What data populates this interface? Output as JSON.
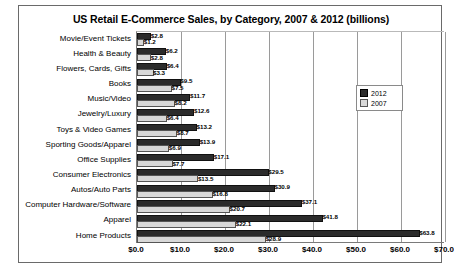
{
  "chart_data": {
    "type": "bar",
    "orientation": "horizontal",
    "title": "US Retail E-Commerce Sales, by Category, 2007 & 2012 (billions)",
    "xlabel": "",
    "ylabel": "",
    "xlim": [
      0,
      70
    ],
    "xtick_step": 10,
    "grid": true,
    "legend_position": "upper right",
    "categories": [
      "Movie/Event Tickets",
      "Health & Beauty",
      "Flowers, Cards, Gifts",
      "Books",
      "Music/Video",
      "Jewelry/Luxury",
      "Toys & Video Games",
      "Sporting Goods/Apparel",
      "Office Supplies",
      "Consumer Electronics",
      "Autos/Auto Parts",
      "Computer Hardware/Software",
      "Apparel",
      "Home Products"
    ],
    "series": [
      {
        "name": "2012",
        "color": "#2b2b2b",
        "values": [
          2.8,
          6.2,
          6.4,
          9.5,
          11.7,
          12.6,
          13.2,
          13.9,
          17.1,
          29.5,
          30.9,
          37.1,
          41.8,
          63.8
        ],
        "labels": [
          "$2.8",
          "$6.2",
          "$6.4",
          "$9.5",
          "$11.7",
          "$12.6",
          "$13.2",
          "$13.9",
          "$17.1",
          "$29.5",
          "$30.9",
          "$37.1",
          "$41.8",
          "$63.8"
        ]
      },
      {
        "name": "2007",
        "color": "#d8d8d8",
        "values": [
          1.2,
          2.8,
          3.3,
          7.5,
          8.2,
          6.4,
          8.7,
          6.9,
          7.7,
          13.5,
          16.8,
          20.7,
          22.1,
          28.9
        ],
        "labels": [
          "$1.2",
          "$2.8",
          "$3.3",
          "$7.5",
          "$8.2",
          "$6.4",
          "$8.7",
          "$6.9",
          "$7.7",
          "$13.5",
          "$16.8",
          "$20.7",
          "$22.1",
          "$28.9"
        ]
      }
    ],
    "xticks": [
      "$0.0",
      "$10.0",
      "$20.0",
      "$30.0",
      "$40.0",
      "$50.0",
      "$60.0",
      "$70.0"
    ],
    "xtick_values": [
      0,
      10,
      20,
      30,
      40,
      50,
      60,
      70
    ]
  },
  "legend": {
    "items": [
      {
        "label": "2012"
      },
      {
        "label": "2007"
      }
    ]
  }
}
